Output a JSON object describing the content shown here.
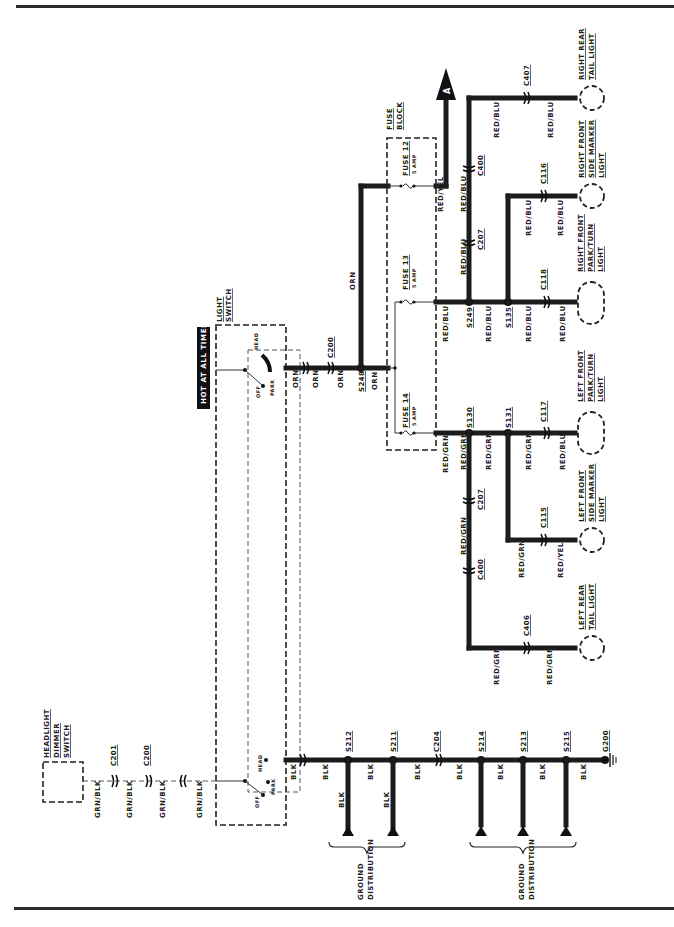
{
  "diagram": {
    "title_badge": "HOT AT ALL TIMES",
    "orientation": "rotated-90-ccw",
    "components": {
      "light_switch": {
        "label_line1": "LIGHT",
        "label_line2": "SWITCH",
        "positions": [
          "OFF",
          "PARK",
          "HEAD"
        ]
      },
      "light_switch_lower": {
        "positions": [
          "OFF",
          "PARK",
          "HEAD"
        ]
      },
      "dimmer_switch": {
        "label_line1": "HEADLIGHT",
        "label_line2": "DIMMER",
        "label_line3": "SWITCH"
      },
      "fuse_block": {
        "label_line1": "FUSE",
        "label_line2": "BLOCK"
      },
      "fuse12": {
        "name": "FUSE 12",
        "rating": "5 AMP"
      },
      "fuse13": {
        "name": "FUSE 13",
        "rating": "5 AMP"
      },
      "fuse14": {
        "name": "FUSE 14",
        "rating": "5 AMP"
      },
      "offpage_ref": "A"
    },
    "lights": {
      "right_rear_tail": {
        "line1": "RIGHT REAR",
        "line2": "TAIL LIGHT"
      },
      "right_front_side_marker": {
        "line1": "RIGHT FRONT",
        "line2": "SIDE MARKER",
        "line3": "LIGHT"
      },
      "right_front_park_turn": {
        "line1": "RIGHT FRONT",
        "line2": "PARK/TURN",
        "line3": "LIGHT"
      },
      "left_front_park_turn": {
        "line1": "LEFT FRONT",
        "line2": "PARK/TURN",
        "line3": "LIGHT"
      },
      "left_front_side_marker": {
        "line1": "LEFT FRONT",
        "line2": "SIDE MARKER",
        "line3": "LIGHT"
      },
      "left_rear_tail": {
        "line1": "LEFT REAR",
        "line2": "TAIL LIGHT"
      }
    },
    "connectors": {
      "c200_top": "C200",
      "c200_bottom": "C200",
      "c201": "C201",
      "c207_right": "C207",
      "c207_left": "C207",
      "c400_right": "C400",
      "c400_left": "C400",
      "c407": "C407",
      "c406": "C406",
      "c116": "C116",
      "c118": "C118",
      "c117": "C117",
      "c115": "C115",
      "c204": "C204"
    },
    "splices": {
      "s248": "S248",
      "s249": "S249",
      "s135": "S135",
      "s130": "S130",
      "s131": "S131",
      "s212": "S212",
      "s211": "S211",
      "s214": "S214",
      "s213": "S213",
      "s215": "S215"
    },
    "ground": {
      "g200": "G200",
      "distribution_line1": "GROUND",
      "distribution_line2": "DISTRIBUTION"
    },
    "wire_colors": {
      "orn": "ORN",
      "red_yel": "RED/YEL",
      "red_blu": "RED/BLU",
      "red_grn": "RED/GRN",
      "grn_blk": "GRN/BLK",
      "blk": "BLK"
    },
    "colors": {
      "ink": "#1c1c1c",
      "paper": "#ffffff",
      "badge_bg": "#111111",
      "badge_text": "#ffffff"
    }
  }
}
